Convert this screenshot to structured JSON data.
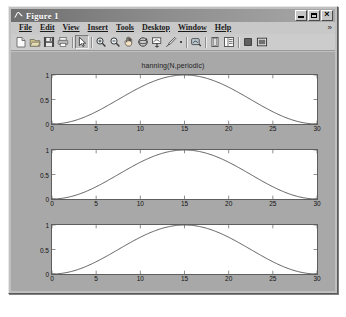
{
  "window": {
    "title": "Figure 1",
    "icon": "matlab-figure-icon",
    "controls": {
      "minimize_label": "_",
      "maximize_label": "□",
      "close_label": "×"
    }
  },
  "menubar": {
    "items": [
      {
        "label": "File",
        "mnemonic": "F"
      },
      {
        "label": "Edit",
        "mnemonic": "E"
      },
      {
        "label": "View",
        "mnemonic": "V"
      },
      {
        "label": "Insert",
        "mnemonic": "I"
      },
      {
        "label": "Tools",
        "mnemonic": "T"
      },
      {
        "label": "Desktop",
        "mnemonic": "D"
      },
      {
        "label": "Window",
        "mnemonic": "W"
      },
      {
        "label": "Help",
        "mnemonic": "H"
      }
    ],
    "overflow_label": "»"
  },
  "toolbar": {
    "buttons": [
      {
        "name": "new-figure-icon",
        "tooltip": "New Figure"
      },
      {
        "name": "open-file-icon",
        "tooltip": "Open File"
      },
      {
        "name": "save-figure-icon",
        "tooltip": "Save Figure"
      },
      {
        "name": "print-figure-icon",
        "tooltip": "Print Figure"
      },
      {
        "name": "edit-plot-icon",
        "tooltip": "Edit Plot"
      },
      {
        "name": "zoom-in-icon",
        "tooltip": "Zoom In"
      },
      {
        "name": "zoom-out-icon",
        "tooltip": "Zoom Out"
      },
      {
        "name": "pan-icon",
        "tooltip": "Pan"
      },
      {
        "name": "rotate-3d-icon",
        "tooltip": "Rotate 3D"
      },
      {
        "name": "data-cursor-icon",
        "tooltip": "Data Cursor"
      },
      {
        "name": "brush-data-icon",
        "tooltip": "Brush/Select Data"
      },
      {
        "name": "link-plot-icon",
        "tooltip": "Link Plot"
      },
      {
        "name": "colorbar-icon",
        "tooltip": "Insert Colorbar"
      },
      {
        "name": "legend-icon",
        "tooltip": "Insert Legend"
      },
      {
        "name": "hide-plot-tools-icon",
        "tooltip": "Hide Plot Tools"
      },
      {
        "name": "show-plot-tools-icon",
        "tooltip": "Show Plot Tools and Dock Figure"
      }
    ]
  },
  "colors": {
    "figure_background": "#a8a8a8",
    "axes_background": "#ffffff",
    "axes_border": "#5e5e5e",
    "line": "#4a4a4a",
    "window_chrome": "#c0c0c0",
    "titlebar": "#8c8c8c",
    "text": "#121212"
  },
  "chart_data": {
    "type": "line",
    "title": "hanning(N,periodic)",
    "xlabel": "",
    "ylabel": "",
    "xlim": [
      0,
      30
    ],
    "ylim": [
      0,
      1
    ],
    "xticks": [
      0,
      5,
      10,
      15,
      20,
      25,
      30
    ],
    "yticks": [
      0,
      0.5,
      1
    ],
    "grid": false,
    "legend": null,
    "subplots": [
      {
        "name": "subplot-1",
        "title": "hanning(N,periodic)",
        "x": [
          0,
          1,
          2,
          3,
          4,
          5,
          6,
          7,
          8,
          9,
          10,
          11,
          12,
          13,
          14,
          15,
          16,
          17,
          18,
          19,
          20,
          21,
          22,
          23,
          24,
          25,
          26,
          27,
          28,
          29,
          30
        ],
        "y": [
          0.0,
          0.011,
          0.043,
          0.095,
          0.165,
          0.25,
          0.346,
          0.448,
          0.552,
          0.654,
          0.75,
          0.835,
          0.905,
          0.957,
          0.989,
          1.0,
          0.989,
          0.957,
          0.905,
          0.835,
          0.75,
          0.654,
          0.552,
          0.448,
          0.346,
          0.25,
          0.165,
          0.095,
          0.043,
          0.011,
          0.0
        ]
      },
      {
        "name": "subplot-2",
        "title": "",
        "x": [
          0,
          1,
          2,
          3,
          4,
          5,
          6,
          7,
          8,
          9,
          10,
          11,
          12,
          13,
          14,
          15,
          16,
          17,
          18,
          19,
          20,
          21,
          22,
          23,
          24,
          25,
          26,
          27,
          28,
          29,
          30
        ],
        "y": [
          0.0,
          0.011,
          0.043,
          0.095,
          0.165,
          0.25,
          0.346,
          0.448,
          0.552,
          0.654,
          0.75,
          0.835,
          0.905,
          0.957,
          0.989,
          1.0,
          0.989,
          0.957,
          0.905,
          0.835,
          0.75,
          0.654,
          0.552,
          0.448,
          0.346,
          0.25,
          0.165,
          0.095,
          0.043,
          0.011,
          0.0
        ]
      },
      {
        "name": "subplot-3",
        "title": "",
        "x": [
          0,
          1,
          2,
          3,
          4,
          5,
          6,
          7,
          8,
          9,
          10,
          11,
          12,
          13,
          14,
          15,
          16,
          17,
          18,
          19,
          20,
          21,
          22,
          23,
          24,
          25,
          26,
          27,
          28,
          29,
          30
        ],
        "y": [
          0.0,
          0.011,
          0.043,
          0.095,
          0.165,
          0.25,
          0.346,
          0.448,
          0.552,
          0.654,
          0.75,
          0.835,
          0.905,
          0.957,
          0.989,
          1.0,
          0.989,
          0.957,
          0.905,
          0.835,
          0.75,
          0.654,
          0.552,
          0.448,
          0.346,
          0.25,
          0.165,
          0.095,
          0.043,
          0.011,
          0.0
        ]
      }
    ]
  }
}
